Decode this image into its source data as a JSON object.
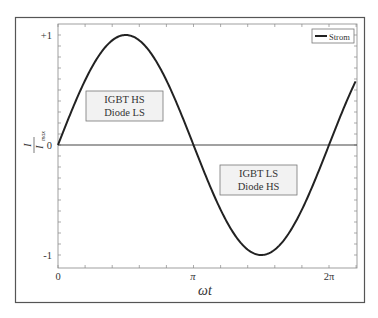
{
  "chart_data": {
    "type": "line",
    "title": "",
    "xlabel": "ωt",
    "ylabel": "I / I_max",
    "ylabel_num": "I",
    "ylabel_den": "I",
    "ylabel_den_sub": "max",
    "x_ticks": [
      {
        "value": 0,
        "label": "0"
      },
      {
        "value": 3.14159,
        "label": "π"
      },
      {
        "value": 6.28318,
        "label": "2π"
      }
    ],
    "y_ticks": [
      {
        "value": 1,
        "label": "+1"
      },
      {
        "value": 0,
        "label": "0"
      },
      {
        "value": -1,
        "label": "-1"
      }
    ],
    "xlim": [
      0,
      6.9
    ],
    "ylim": [
      -1.1,
      1.1
    ],
    "grid": false,
    "legend": {
      "position": "upper right",
      "entries": [
        "Strom"
      ]
    },
    "series": [
      {
        "name": "Strom",
        "function": "sin(ωt)",
        "x_range": [
          0,
          6.9
        ],
        "color": "#222222"
      }
    ],
    "annotations": [
      {
        "line1": "IGBT HS",
        "line2": "Diode LS",
        "region": "positive half-wave"
      },
      {
        "line1": "IGBT LS",
        "line2": "Diode HS",
        "region": "negative half-wave"
      }
    ]
  },
  "colors": {
    "curve": "#222222",
    "axis": "#555555",
    "box_fill": "#f2f2f2",
    "box_border": "#777777"
  }
}
